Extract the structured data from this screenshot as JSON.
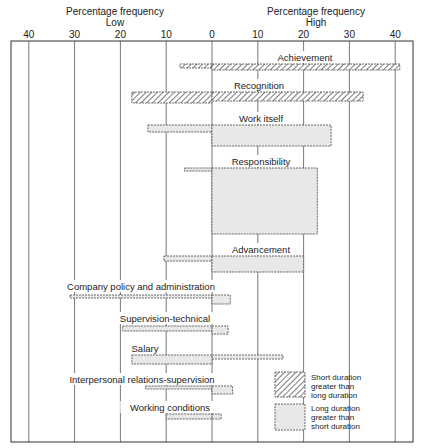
{
  "chart_data": {
    "type": "bar",
    "orientation": "horizontal-diverging",
    "title": "",
    "axis_left_label": "Percentage frequency",
    "axis_left_sublabel": "Low",
    "axis_right_label": "Percentage frequency",
    "axis_right_sublabel": "High",
    "tick_labels": [
      "40",
      "30",
      "20",
      "10",
      "0",
      "10",
      "20",
      "30",
      "40"
    ],
    "tick_values": [
      -40,
      -30,
      -20,
      -10,
      0,
      10,
      20,
      30,
      40
    ],
    "xlim": [
      -40,
      40
    ],
    "grid": true,
    "legend": [
      {
        "name": "Short duration greater than long duration",
        "lines": [
          "Short duration",
          "greater than",
          "long duration"
        ],
        "pattern": "hatched"
      },
      {
        "name": "Long duration greater than short duration",
        "lines": [
          "Long duration",
          "greater than",
          "short duration"
        ],
        "pattern": "gray"
      }
    ],
    "legend_position": "bottom-right",
    "categories": [
      "Achievement",
      "Recognition",
      "Work itself",
      "Responsibility",
      "Advancement",
      "Company policy and administration",
      "Supervision-technical",
      "Salary",
      "Interpersonal relations-supervision",
      "Working conditions"
    ],
    "series": [
      {
        "name": "Low",
        "values": [
          7,
          17.5,
          14,
          6,
          10.5,
          31,
          19.5,
          17.5,
          14.5,
          10
        ]
      },
      {
        "name": "High",
        "values": [
          41,
          33,
          26,
          23,
          20,
          4,
          3.5,
          15.5,
          4.5,
          2
        ]
      }
    ],
    "bars": [
      {
        "label": "Achievement",
        "low": 7,
        "high": 41,
        "pattern": "hatched",
        "top": 64,
        "low_bottom": 68,
        "high_bottom": 70,
        "label_x": 305,
        "label_y": 61
      },
      {
        "label": "Recognition",
        "low": 17.5,
        "high": 33,
        "pattern": "hatched",
        "top": 92,
        "low_bottom": 103,
        "high_bottom": 101,
        "label_x": 259,
        "label_y": 89
      },
      {
        "label": "Work itself",
        "low": 14,
        "high": 26,
        "pattern": "gray",
        "top": 125,
        "low_bottom": 132,
        "high_bottom": 146,
        "label_x": 261,
        "label_y": 122
      },
      {
        "label": "Responsibility",
        "low": 6,
        "high": 23,
        "pattern": "gray",
        "top": 168,
        "low_bottom": 171,
        "high_bottom": 234,
        "label_x": 261,
        "label_y": 165
      },
      {
        "label": "Advancement",
        "low": 10.5,
        "high": 20,
        "pattern": "gray",
        "top": 256,
        "low_bottom": 261,
        "high_bottom": 272,
        "label_x": 261,
        "label_y": 253
      },
      {
        "label": "Company policy and administration",
        "low": 31,
        "high": 4,
        "pattern": "gray",
        "top": 295,
        "low_bottom": 298,
        "high_bottom": 304,
        "label_x": 141,
        "label_y": 290
      },
      {
        "label": "Supervision-technical",
        "low": 19.5,
        "high": 3.5,
        "pattern": "gray",
        "top": 326,
        "low_bottom": 331,
        "high_bottom": 334,
        "label_x": 165,
        "label_y": 322
      },
      {
        "label": "Salary",
        "low": 17.5,
        "high": 15.5,
        "pattern": "gray",
        "top": 355,
        "low_bottom": 364,
        "high_bottom": 359,
        "label_x": 145,
        "label_y": 352
      },
      {
        "label": "Interpersonal relations-supervision",
        "low": 14.5,
        "high": 4.5,
        "pattern": "gray",
        "top": 386,
        "low_bottom": 389,
        "high_bottom": 394,
        "label_x": 142,
        "label_y": 383
      },
      {
        "label": "Working conditions",
        "low": 10,
        "high": 2,
        "pattern": "gray",
        "top": 414,
        "low_bottom": 419,
        "high_bottom": 419,
        "label_x": 170,
        "label_y": 411
      }
    ]
  },
  "header": {
    "left_title": "Percentage frequency",
    "left_sub": "Low",
    "right_title": "Percentage frequency",
    "right_sub": "High"
  },
  "colors": {
    "frame": "#333333",
    "grid": "#555555",
    "bar_fill": "#e8e8e8",
    "hatch": "#444444",
    "background": "#ffffff"
  }
}
